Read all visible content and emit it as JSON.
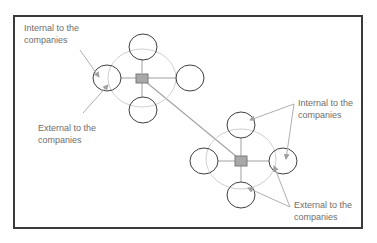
{
  "diagram": {
    "type": "network-clusters",
    "colors": {
      "frame": "#3a3a3a",
      "satellite_stroke": "#404040",
      "boundary_ellipse": "#c8c8c8",
      "spoke": "#9a9a9a",
      "hub_fill": "#a8a8a8",
      "hub_stroke": "#7a7a7a",
      "arrow": "#b0b0b0",
      "label_text": "#6e6e6e"
    },
    "clusters": [
      {
        "name": "company-cluster-1",
        "hub": {
          "x": 142,
          "y": 78
        },
        "boundary": {
          "cx": 142,
          "cy": 78,
          "rx": 34,
          "ry": 29
        },
        "satellites": [
          {
            "position": "top",
            "cx": 143,
            "cy": 47
          },
          {
            "position": "left",
            "cx": 107,
            "cy": 78
          },
          {
            "position": "right",
            "cx": 190,
            "cy": 78
          },
          {
            "position": "bottom",
            "cx": 143,
            "cy": 110
          }
        ]
      },
      {
        "name": "company-cluster-2",
        "hub": {
          "x": 241,
          "y": 161
        },
        "boundary": {
          "cx": 241,
          "cy": 159,
          "rx": 35,
          "ry": 30
        },
        "satellites": [
          {
            "position": "top",
            "cx": 241,
            "cy": 125
          },
          {
            "position": "left",
            "cx": 204,
            "cy": 161
          },
          {
            "position": "right",
            "cx": 283,
            "cy": 161
          },
          {
            "position": "bottom",
            "cx": 241,
            "cy": 195
          }
        ]
      }
    ],
    "connector": {
      "from": "company-cluster-1",
      "to": "company-cluster-2"
    },
    "labels": [
      {
        "id": "internal-left",
        "line1": "Internal to the",
        "line2": "companies",
        "x": 24,
        "y": 22
      },
      {
        "id": "external-left",
        "line1": "External to the",
        "line2": "companies",
        "x": 38,
        "y": 122
      },
      {
        "id": "internal-right",
        "line1": "Internal to the",
        "line2": "companies",
        "x": 298,
        "y": 97
      },
      {
        "id": "external-right",
        "line1": "External to the",
        "line2": "companies",
        "x": 294,
        "y": 199
      }
    ]
  }
}
